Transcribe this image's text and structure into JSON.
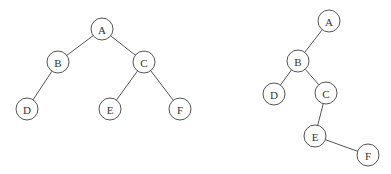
{
  "diagram": {
    "type": "binary-trees",
    "node_radius": 11,
    "trees": [
      {
        "id": "tree-1",
        "nodes": [
          {
            "label": "A",
            "x": 102,
            "y": 29
          },
          {
            "label": "B",
            "x": 58,
            "y": 62
          },
          {
            "label": "C",
            "x": 144,
            "y": 62
          },
          {
            "label": "D",
            "x": 27,
            "y": 109
          },
          {
            "label": "E",
            "x": 110,
            "y": 109
          },
          {
            "label": "F",
            "x": 180,
            "y": 109
          }
        ],
        "edges": [
          [
            "A",
            "B"
          ],
          [
            "A",
            "C"
          ],
          [
            "B",
            "D"
          ],
          [
            "C",
            "E"
          ],
          [
            "C",
            "F"
          ]
        ]
      },
      {
        "id": "tree-2",
        "nodes": [
          {
            "label": "A",
            "x": 329,
            "y": 21
          },
          {
            "label": "B",
            "x": 298,
            "y": 61
          },
          {
            "label": "D",
            "x": 274,
            "y": 94
          },
          {
            "label": "C",
            "x": 326,
            "y": 93
          },
          {
            "label": "E",
            "x": 315,
            "y": 136
          },
          {
            "label": "F",
            "x": 368,
            "y": 155
          }
        ],
        "edges": [
          [
            "A",
            "B"
          ],
          [
            "B",
            "D"
          ],
          [
            "B",
            "C"
          ],
          [
            "C",
            "E"
          ],
          [
            "E",
            "F"
          ]
        ]
      }
    ]
  }
}
